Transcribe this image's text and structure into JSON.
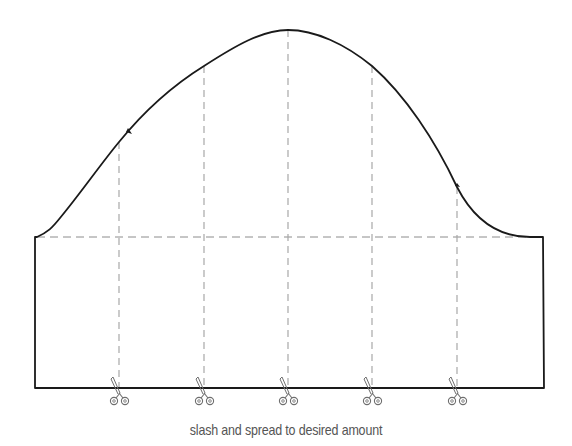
{
  "diagram": {
    "caption": "slash and spread to desired amount",
    "colors": {
      "outline": "#1a1a1a",
      "slash_lines": "#a8a8a8",
      "biceps_line": "#8c8c8c",
      "scissors": "#6e6e6e",
      "caption": "#555555"
    },
    "slash_lines": [
      {
        "id": 1,
        "x": 119
      },
      {
        "id": 2,
        "x": 204
      },
      {
        "id": 3,
        "x": 288
      },
      {
        "id": 4,
        "x": 372
      },
      {
        "id": 5,
        "x": 457
      }
    ],
    "icons": [
      "scissors-icon",
      "scissors-icon",
      "scissors-icon",
      "scissors-icon",
      "scissors-icon"
    ]
  }
}
